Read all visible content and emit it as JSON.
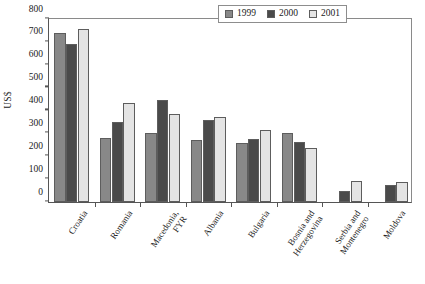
{
  "chart_data": {
    "type": "bar",
    "title": "",
    "subtitle": "",
    "xlabel": "",
    "ylabel": "US$",
    "ylim": [
      0,
      800
    ],
    "yticks": [
      0,
      100,
      200,
      300,
      400,
      500,
      600,
      700,
      800
    ],
    "grid": false,
    "legend_position": "top-right",
    "categories": [
      "Croatia",
      "Romania",
      "Macedonia, FYR",
      "Albania",
      "Bulgaria",
      "Bosnia and Herzegovina",
      "Serbia and Montenegro",
      "Moldova"
    ],
    "category_lines": [
      [
        "Croatia"
      ],
      [
        "Romania"
      ],
      [
        "Macedonia,",
        "FYR"
      ],
      [
        "Albania"
      ],
      [
        "Bulgaria"
      ],
      [
        "Bosnia and",
        "Herzegovina"
      ],
      [
        "Serbia and",
        "Montenegro"
      ],
      [
        "Moldova"
      ]
    ],
    "series": [
      {
        "name": "1999",
        "color": "#888888",
        "values": [
          730,
          277,
          297,
          270,
          255,
          298,
          null,
          null
        ]
      },
      {
        "name": "2000",
        "color": "#4a4a4a",
        "values": [
          685,
          345,
          442,
          355,
          272,
          258,
          47,
          73
        ]
      },
      {
        "name": "2001",
        "color": "#e4e4e4",
        "values": [
          748,
          427,
          380,
          367,
          313,
          234,
          92,
          85
        ]
      }
    ]
  },
  "legend": {
    "entries": [
      {
        "label": "1999",
        "icon": "legend-swatch-1999"
      },
      {
        "label": "2000",
        "icon": "legend-swatch-2000"
      },
      {
        "label": "2001",
        "icon": "legend-swatch-2001"
      }
    ]
  }
}
